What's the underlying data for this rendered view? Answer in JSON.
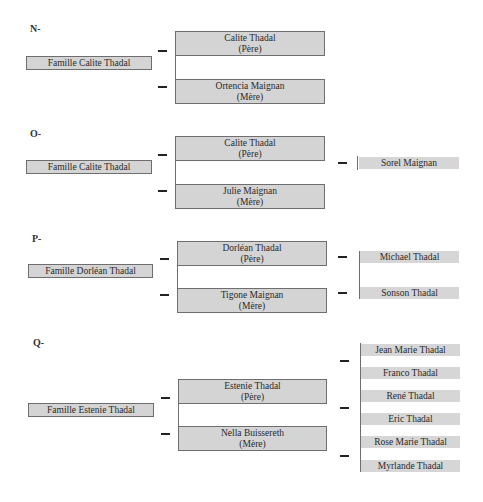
{
  "sections": [
    {
      "label": "N-",
      "family": "Famille Calite Thadal",
      "father": {
        "name": "Calite Thadal",
        "role": "(Père)"
      },
      "mother": {
        "name": "Ortencia Maignan",
        "role": "(Mère)"
      },
      "children": []
    },
    {
      "label": "O-",
      "family": "Famille Calite Thadal",
      "father": {
        "name": "Calite Thadal",
        "role": "(Père)"
      },
      "mother": {
        "name": "Julie Maignan",
        "role": "(Mère)"
      },
      "children": [
        "Sorel Maignan"
      ]
    },
    {
      "label": "P-",
      "family": "Famille Dorléan Thadal",
      "father": {
        "name": "Dorléan Thadal",
        "role": "(Père)"
      },
      "mother": {
        "name": "Tigone Maignan",
        "role": "(Mère)"
      },
      "children": [
        "Michael Thadal",
        "Sonson Thadal"
      ]
    },
    {
      "label": "Q-",
      "family": "Famille Estenie Thadal",
      "father": {
        "name": "Estenie Thadal",
        "role": "(Père)"
      },
      "mother": {
        "name": "Nella Buissereth",
        "role": "(Mère)"
      },
      "children": [
        "Jean Marie Thadal",
        "Franco Thadal",
        "René Thadal",
        "Eric Thadal",
        "Rose Marie Thadal",
        "Myrlande Thadal"
      ]
    }
  ],
  "colors": {
    "box_fill": "#d4d4d4",
    "box_border": "#6e6e6e",
    "dash": "#222222"
  }
}
